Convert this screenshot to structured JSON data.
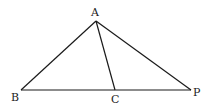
{
  "diagram": {
    "points": {
      "A": {
        "label": "A",
        "x": 96,
        "y": 21
      },
      "B": {
        "label": "B",
        "x": 21,
        "y": 90
      },
      "C": {
        "label": "C",
        "x": 115,
        "y": 90
      },
      "P": {
        "label": "P",
        "x": 191,
        "y": 90
      }
    },
    "segments": [
      "AB",
      "AC",
      "AP",
      "BP"
    ]
  }
}
